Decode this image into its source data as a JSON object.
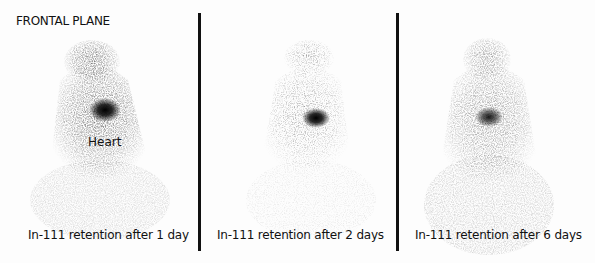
{
  "figure": {
    "plane_label": "FRONTAL PLANE",
    "heart_label": "Heart",
    "panels": [
      {
        "caption": "In-111 retention after 1 day",
        "hotspot": {
          "x": 107,
          "y": 112
        }
      },
      {
        "caption": "In-111 retention after 2 days",
        "hotspot": {
          "x": 316,
          "y": 118
        }
      },
      {
        "caption": "In-111 retention after 6 days",
        "hotspot": {
          "x": 488,
          "y": 118
        }
      }
    ],
    "colors": {
      "background": "#ffffff",
      "divider": "#111111",
      "text": "#111111"
    }
  }
}
